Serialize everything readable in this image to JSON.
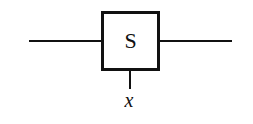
{
  "diagram": {
    "block": {
      "label": "S"
    },
    "input": {
      "label": "x"
    },
    "colors": {
      "stroke": "#111111",
      "background": "#ffffff"
    }
  }
}
